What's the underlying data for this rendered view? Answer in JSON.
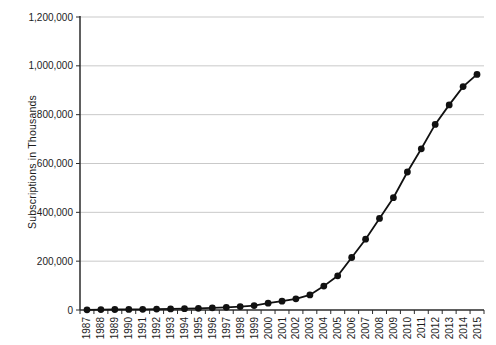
{
  "chart_data": {
    "type": "line",
    "title": "",
    "xlabel": "",
    "ylabel": "Subscriptions in Thousands",
    "categories": [
      "1987",
      "1988",
      "1989",
      "1990",
      "1991",
      "1992",
      "1993",
      "1994",
      "1995",
      "1996",
      "1997",
      "1998",
      "1999",
      "2000",
      "2001",
      "2002",
      "2003",
      "2004",
      "2005",
      "2006",
      "2007",
      "2008",
      "2009",
      "2010",
      "2011",
      "2012",
      "2013",
      "2014",
      "2015"
    ],
    "values": [
      1000,
      1500,
      2000,
      2500,
      3000,
      3500,
      4500,
      5500,
      7000,
      9000,
      11000,
      14000,
      18000,
      28000,
      36000,
      46000,
      62000,
      98000,
      140000,
      215000,
      290000,
      375000,
      460000,
      565000,
      660000,
      760000,
      840000,
      915000,
      965000
    ],
    "ylim": [
      0,
      1200000
    ],
    "ytick_interval": 200000,
    "ytick_labels": [
      "0",
      "200,000",
      "400,000",
      "600,000",
      "800,000",
      "1,000,000",
      "1,200,000"
    ],
    "grid": "horizontal",
    "legend": "none",
    "line_color": "#111111",
    "marker": "circle",
    "marker_color": "#111111",
    "gridline_color": "#c9c9c9",
    "axis_color": "#2b2b2b"
  }
}
